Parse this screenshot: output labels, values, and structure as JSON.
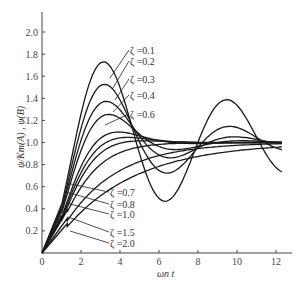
{
  "chart_data": {
    "type": "line",
    "title": "",
    "xlabel": "ωn t",
    "ylabel": "ψ/Km(A) , ψ(B)",
    "xlim": [
      0,
      13
    ],
    "ylim": [
      0,
      2.1
    ],
    "x_ticks": [
      "0",
      "2",
      "4",
      "6",
      "8",
      "10",
      "12"
    ],
    "y_ticks": [
      "0.2",
      "0.4",
      "0.6",
      "0.8",
      "1.0",
      "1.2",
      "1.4",
      "1.6",
      "1.8",
      "2.0"
    ],
    "grid": false,
    "legend_position": "inline-annotations",
    "series": [
      {
        "name": "ζ=0.1",
        "zeta": 0.1,
        "peak": [
          2.8,
          1.8
        ]
      },
      {
        "name": "ζ=0.2",
        "zeta": 0.2,
        "peak": [
          3.2,
          1.57
        ]
      },
      {
        "name": "ζ=0.3",
        "zeta": 0.3,
        "peak": [
          3.3,
          1.42
        ]
      },
      {
        "name": "ζ=0.4",
        "zeta": 0.4,
        "peak": [
          3.4,
          1.3
        ]
      },
      {
        "name": "ζ=0.6",
        "zeta": 0.6,
        "peak": [
          4.0,
          1.13
        ]
      },
      {
        "name": "ζ=0.7",
        "zeta": 0.7,
        "peak": [
          4.5,
          1.08
        ]
      },
      {
        "name": "ζ=0.8",
        "zeta": 0.8,
        "peak": [
          5.5,
          1.05
        ]
      },
      {
        "name": "ζ=1.0",
        "zeta": 1.0,
        "final": 1.0
      },
      {
        "name": "ζ=1.5",
        "zeta": 1.5,
        "final": 1.0
      },
      {
        "name": "ζ=2.0",
        "zeta": 2.0,
        "final": 1.0
      }
    ]
  },
  "labels": {
    "x_axis_title": "ωn t",
    "y_axis_title": "ψ/Km(A) , ψ(B)",
    "legend_upper": [
      "ζ =0.1",
      "ζ =0.2",
      "ζ =0.3",
      "ζ =0.4",
      "ζ =0.6"
    ],
    "legend_lower": [
      "ζ =0.7",
      "ζ =0.8",
      "ζ =1.0",
      "ζ =1.5",
      "ζ =2.0"
    ]
  }
}
